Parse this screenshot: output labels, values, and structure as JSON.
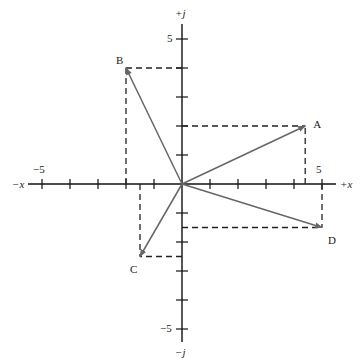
{
  "diagram": {
    "type": "complex-plane-vectors",
    "axes": {
      "x_pos_label": "+x",
      "x_neg_label": "−x",
      "y_pos_label": "+j",
      "y_neg_label": "−j",
      "x_tick_min_label": "−5",
      "x_tick_max_label": "5",
      "y_tick_max_label": "5",
      "y_tick_min_label": "−5",
      "range": [
        -5,
        5
      ]
    },
    "vectors": [
      {
        "label": "A",
        "x": 4.4,
        "y": 2
      },
      {
        "label": "B",
        "x": -2,
        "y": 4
      },
      {
        "label": "C",
        "x": -1.5,
        "y": -2.5
      },
      {
        "label": "D",
        "x": 5,
        "y": -1.5
      }
    ],
    "colors": {
      "axis": "#111111",
      "vector": "#666666",
      "dashed": "#222222"
    }
  }
}
